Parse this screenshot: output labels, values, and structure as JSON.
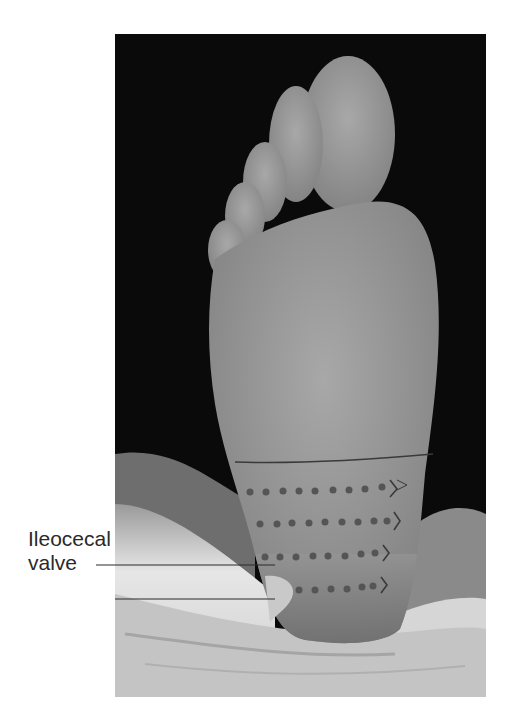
{
  "figure": {
    "callout": {
      "label_line1": "Ileocecal",
      "label_line2": "valve",
      "target": "ileocecal-valve-point"
    },
    "markings": {
      "transverse_line": 1,
      "dotted_rows": 4,
      "dots_per_row": [
        9,
        9,
        8,
        6
      ],
      "arrow_direction": "right"
    },
    "colors": {
      "background": "#0a0a0a",
      "skin": "#9a9a9a",
      "sheet": "#d8d8d8",
      "dots": "#555555",
      "valve_highlight": "#c9c9c9",
      "line": "#3a3a3a"
    }
  }
}
